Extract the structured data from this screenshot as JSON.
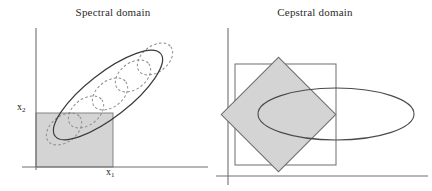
{
  "figure": {
    "background_color": "#ffffff",
    "line_color": "#3a3a3a",
    "dash_color": "#8a8a8a",
    "axis_color": "#6f6f6f",
    "shade_fill": "#d4d4d4",
    "shade_stroke": "#7a7a7a"
  },
  "panels": [
    {
      "id": "spectral",
      "title": "Spectral domain",
      "axes": {
        "x_label": "x",
        "x_label_sub": "1",
        "y_label": "x",
        "y_label_sub": "2",
        "origin_x": 36,
        "origin_y": 167,
        "y_axis_top": 28,
        "x_axis_right": 208
      },
      "shaded_region": {
        "shape": "rectangle",
        "x": 36,
        "y": 113,
        "width": 77,
        "height": 54,
        "fill": "#d4d4d4"
      },
      "outer_ellipse": {
        "style": "solid",
        "cx": 108,
        "cy": 95,
        "rx": 67,
        "ry": 22,
        "rotation_deg": -38
      },
      "inner_ellipses": [
        {
          "style": "dashed",
          "cx": 64,
          "cy": 129,
          "rx": 20,
          "ry": 13,
          "rotation_deg": -38
        },
        {
          "style": "dashed",
          "cx": 86,
          "cy": 112,
          "rx": 20,
          "ry": 13,
          "rotation_deg": -38
        },
        {
          "style": "dashed",
          "cx": 110,
          "cy": 94,
          "rx": 20,
          "ry": 13,
          "rotation_deg": -38
        },
        {
          "style": "dashed",
          "cx": 133,
          "cy": 76,
          "rx": 20,
          "ry": 13,
          "rotation_deg": -38
        },
        {
          "style": "dashed",
          "cx": 155,
          "cy": 59,
          "rx": 20,
          "ry": 13,
          "rotation_deg": -38
        }
      ]
    },
    {
      "id": "cepstral",
      "title": "Cepstral domain",
      "axes": {
        "origin_x": 12,
        "origin_y": 176,
        "y_axis_top": 28,
        "x_axis_right": 216
      },
      "square_outline": {
        "shape": "rectangle",
        "x": 19,
        "y": 64,
        "width": 101,
        "height": 101
      },
      "shaded_region": {
        "shape": "diamond",
        "cx": 62,
        "cy": 114,
        "half_diagonal": 57,
        "rotation_deg": 45,
        "fill": "#d4d4d4"
      },
      "ellipse": {
        "style": "solid",
        "cx": 120,
        "cy": 114,
        "rx": 78,
        "ry": 26,
        "rotation_deg": 0
      }
    }
  ]
}
